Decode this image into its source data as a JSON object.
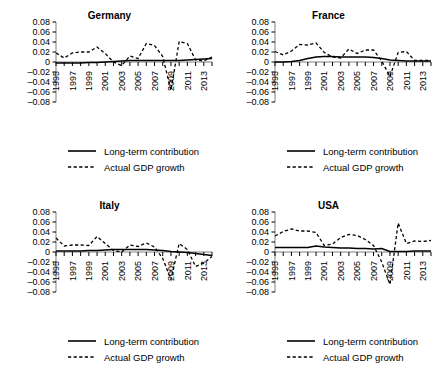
{
  "figure": {
    "background": "#ffffff",
    "line_color": "#000000",
    "panel_count": 4
  },
  "legend": {
    "solid_label": "Long-term contribution",
    "dashed_label": "Actual GDP growth"
  },
  "axis": {
    "ylim": [
      -0.08,
      0.08
    ],
    "yticks": [
      "0.08",
      "0.06",
      "0.04",
      "0.02",
      "0",
      "–0.02",
      "–0.04",
      "–0.06",
      "–0.08"
    ],
    "ytick_values": [
      0.08,
      0.06,
      0.04,
      0.02,
      0,
      -0.02,
      -0.04,
      -0.06,
      -0.08
    ],
    "xlim": [
      1995,
      2014
    ],
    "xticks": [
      "1995",
      "1997",
      "1999",
      "2001",
      "2003",
      "2005",
      "2007",
      "2009",
      "2011",
      "2013"
    ],
    "xtick_values": [
      1995,
      1997,
      1999,
      2001,
      2003,
      2005,
      2007,
      2009,
      2011,
      2013
    ],
    "grid": false,
    "xlabel": "",
    "ylabel": ""
  },
  "chart_data": [
    {
      "type": "line",
      "title": "Germany",
      "xlabel": "",
      "ylabel": "",
      "ylim": [
        -0.08,
        0.08
      ],
      "xlim": [
        1995,
        2014
      ],
      "grid": false,
      "legend_position": "below",
      "x": [
        1995,
        1996,
        1997,
        1998,
        1999,
        2000,
        2001,
        2002,
        2003,
        2004,
        2005,
        2006,
        2007,
        2008,
        2009,
        2010,
        2011,
        2012,
        2013,
        2014
      ],
      "series": [
        {
          "name": "Long-term contribution",
          "style": "solid",
          "values": [
            -0.002,
            -0.002,
            -0.002,
            -0.002,
            -0.001,
            -0.001,
            0.0,
            0.001,
            0.002,
            0.003,
            0.003,
            0.003,
            0.003,
            0.003,
            0.003,
            0.003,
            0.004,
            0.005,
            0.006,
            0.007
          ]
        },
        {
          "name": "Actual GDP growth",
          "style": "dashed",
          "values": [
            0.018,
            0.008,
            0.018,
            0.02,
            0.02,
            0.03,
            0.017,
            0.0,
            -0.007,
            0.012,
            0.007,
            0.037,
            0.033,
            0.011,
            -0.057,
            0.041,
            0.037,
            0.004,
            0.002,
            0.01
          ]
        }
      ]
    },
    {
      "type": "line",
      "title": "France",
      "xlabel": "",
      "ylabel": "",
      "ylim": [
        -0.08,
        0.08
      ],
      "xlim": [
        1995,
        2014
      ],
      "grid": false,
      "legend_position": "below",
      "x": [
        1995,
        1996,
        1997,
        1998,
        1999,
        2000,
        2001,
        2002,
        2003,
        2004,
        2005,
        2006,
        2007,
        2008,
        2009,
        2010,
        2011,
        2012,
        2013,
        2014
      ],
      "series": [
        {
          "name": "Long-term contribution",
          "style": "solid",
          "values": [
            0.0,
            0.0,
            0.001,
            0.003,
            0.007,
            0.01,
            0.011,
            0.011,
            0.01,
            0.01,
            0.01,
            0.01,
            0.009,
            0.007,
            0.004,
            0.003,
            0.002,
            0.002,
            0.002,
            0.002
          ]
        },
        {
          "name": "Actual GDP growth",
          "style": "dashed",
          "values": [
            0.021,
            0.014,
            0.022,
            0.035,
            0.034,
            0.038,
            0.019,
            0.01,
            0.008,
            0.026,
            0.017,
            0.024,
            0.024,
            0.002,
            -0.029,
            0.019,
            0.021,
            0.003,
            0.003,
            0.003
          ]
        }
      ]
    },
    {
      "type": "line",
      "title": "Italy",
      "xlabel": "",
      "ylabel": "",
      "ylim": [
        -0.08,
        0.08
      ],
      "xlim": [
        1995,
        2014
      ],
      "grid": false,
      "legend_position": "below",
      "x": [
        1995,
        1996,
        1997,
        1998,
        1999,
        2000,
        2001,
        2002,
        2003,
        2004,
        2005,
        2006,
        2007,
        2008,
        2009,
        2010,
        2011,
        2012,
        2013,
        2014
      ],
      "series": [
        {
          "name": "Long-term contribution",
          "style": "solid",
          "values": [
            0.002,
            0.002,
            0.002,
            0.002,
            0.003,
            0.003,
            0.004,
            0.005,
            0.005,
            0.005,
            0.005,
            0.005,
            0.004,
            0.003,
            0.001,
            0.0,
            -0.001,
            -0.003,
            -0.005,
            -0.007
          ]
        },
        {
          "name": "Actual GDP growth",
          "style": "dashed",
          "values": [
            0.028,
            0.012,
            0.014,
            0.014,
            0.013,
            0.031,
            0.017,
            0.003,
            0.0,
            0.014,
            0.011,
            0.018,
            0.01,
            -0.013,
            -0.055,
            0.017,
            0.005,
            -0.029,
            -0.022,
            -0.009
          ]
        }
      ]
    },
    {
      "type": "line",
      "title": "USA",
      "xlabel": "",
      "ylabel": "",
      "ylim": [
        -0.08,
        0.08
      ],
      "xlim": [
        1995,
        2014
      ],
      "grid": false,
      "legend_position": "below",
      "x": [
        1995,
        1996,
        1997,
        1998,
        1999,
        2000,
        2001,
        2002,
        2003,
        2004,
        2005,
        2006,
        2007,
        2008,
        2009,
        2010,
        2011,
        2012,
        2013,
        2014
      ],
      "series": [
        {
          "name": "Long-term contribution",
          "style": "solid",
          "values": [
            0.009,
            0.009,
            0.009,
            0.009,
            0.009,
            0.012,
            0.01,
            0.009,
            0.008,
            0.008,
            0.007,
            0.007,
            0.006,
            0.007,
            0.001,
            0.001,
            0.001,
            0.002,
            0.002,
            0.002
          ]
        },
        {
          "name": "Actual GDP growth",
          "style": "dashed",
          "values": [
            0.032,
            0.041,
            0.046,
            0.042,
            0.042,
            0.039,
            0.013,
            0.016,
            0.029,
            0.035,
            0.033,
            0.025,
            0.013,
            -0.02,
            -0.065,
            0.058,
            0.017,
            0.022,
            0.021,
            0.023
          ]
        }
      ]
    }
  ]
}
